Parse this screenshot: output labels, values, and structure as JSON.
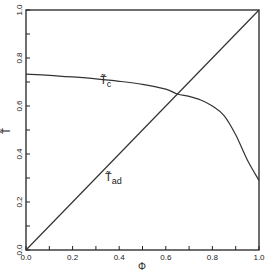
{
  "chart_data": {
    "type": "line",
    "title": "",
    "xlabel": "Φ",
    "ylabel": "T̃",
    "xlim": [
      0.0,
      1.0
    ],
    "ylim": [
      0.0,
      1.0
    ],
    "grid": false,
    "legend": "none (inline curve labels)",
    "x_ticks": [
      "0.0",
      "0.2",
      "0.4",
      "0.6",
      "0.8",
      "1.0"
    ],
    "y_ticks": [
      "0.0",
      "0.2",
      "0.4",
      "0.6",
      "0.8",
      "1.0"
    ],
    "series": [
      {
        "name": "T̃c",
        "label_main": "T̃",
        "label_sub": "c",
        "x": [
          0.0,
          0.1,
          0.2,
          0.3,
          0.4,
          0.5,
          0.6,
          0.65,
          0.7,
          0.75,
          0.8,
          0.85,
          0.9,
          0.95,
          1.0
        ],
        "y": [
          0.733,
          0.728,
          0.721,
          0.713,
          0.703,
          0.69,
          0.67,
          0.65,
          0.64,
          0.625,
          0.6,
          0.56,
          0.48,
          0.375,
          0.29
        ]
      },
      {
        "name": "T̃ad",
        "label_main": "T̃",
        "label_sub": "ad",
        "x": [
          0.0,
          1.0
        ],
        "y": [
          0.0,
          1.0
        ]
      }
    ],
    "annotations": [
      {
        "text": "T̃c",
        "x": 0.5,
        "y": 0.77
      },
      {
        "text": "T̃ad",
        "x": 0.35,
        "y": 0.3
      }
    ]
  }
}
